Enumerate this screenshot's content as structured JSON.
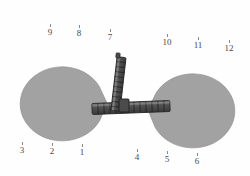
{
  "scene": {
    "title": "Two-gripper chain linkage diagram",
    "width": 250,
    "height": 176,
    "background_color": "#fefefe"
  },
  "colors": {
    "body_fill": "#a2a2a2",
    "body_stroke": "#8f8f8f",
    "chain_fill": "#595959",
    "chain_stroke": "#2b2b2b",
    "chain_highlight": "#7c7c7c",
    "label_text": "#4a4a4a",
    "tick": "#8a8a8a"
  },
  "bodies": [
    {
      "name": "left-gripper",
      "shape": "pacman",
      "center_x": 64,
      "center_y": 103,
      "radius_x": 42,
      "radius_y": 37,
      "mouth_direction": "right",
      "mouth_angle_deg": 46
    },
    {
      "name": "right-gripper",
      "shape": "pacman",
      "center_x": 190,
      "center_y": 110,
      "radius_x": 42,
      "radius_y": 37,
      "mouth_direction": "left",
      "mouth_angle_deg": 46
    }
  ],
  "chains": [
    {
      "name": "horizontal-chain",
      "orientation": "horizontal",
      "x1": 92,
      "y1": 108,
      "x2": 168,
      "y2": 104,
      "thickness": 11,
      "segments": 13
    },
    {
      "name": "vertical-chain",
      "orientation": "vertical",
      "x1": 119,
      "y1": 57,
      "x2": 126,
      "y2": 108,
      "thickness": 9,
      "segments": 12
    }
  ],
  "markers": [
    {
      "label": "1",
      "x": 82,
      "y": 150
    },
    {
      "label": "2",
      "x": 52,
      "y": 149
    },
    {
      "label": "3",
      "x": 22,
      "y": 148
    },
    {
      "label": "4",
      "x": 137,
      "y": 155
    },
    {
      "label": "5",
      "x": 167,
      "y": 157
    },
    {
      "label": "6",
      "x": 197,
      "y": 159
    },
    {
      "label": "7",
      "x": 110,
      "y": 35
    },
    {
      "label": "8",
      "x": 79,
      "y": 31
    },
    {
      "label": "9",
      "x": 50,
      "y": 30
    },
    {
      "label": "10",
      "x": 167,
      "y": 40
    },
    {
      "label": "11",
      "x": 198,
      "y": 43
    },
    {
      "label": "12",
      "x": 229,
      "y": 46
    }
  ]
}
